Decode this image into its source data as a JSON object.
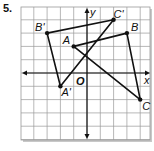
{
  "problem_number": "5.",
  "graph": {
    "origin_px": [
      87,
      73
    ],
    "cell_px": 13.3,
    "x_range": [
      -5,
      4.75
    ],
    "y_range": [
      -5,
      5
    ],
    "axis_labels": {
      "x": "x",
      "y": "y",
      "origin": "O"
    },
    "line_color": "#111111",
    "grid_color": "#9a9a9a",
    "shadow_color": "#c8c8c8"
  },
  "triangles": [
    {
      "name": "ABC",
      "vertices": [
        {
          "label": "A",
          "x": -1,
          "y": 2,
          "label_offset": [
            -11,
            -2
          ]
        },
        {
          "label": "B",
          "x": 3,
          "y": 3,
          "label_offset": [
            4,
            -2
          ]
        },
        {
          "label": "C",
          "x": 4,
          "y": -2,
          "label_offset": [
            2,
            10
          ]
        }
      ]
    },
    {
      "name": "A'B'C'",
      "vertices": [
        {
          "label": "A'",
          "x": -2,
          "y": -1,
          "label_offset": [
            1,
            10
          ]
        },
        {
          "label": "B'",
          "x": -3,
          "y": 3,
          "label_offset": [
            -12,
            -2
          ]
        },
        {
          "label": "C'",
          "x": 2,
          "y": 4,
          "label_offset": [
            0,
            -2
          ]
        }
      ]
    }
  ]
}
